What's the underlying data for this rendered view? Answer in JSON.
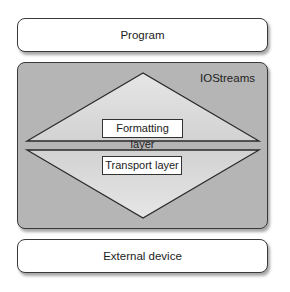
{
  "diagram": {
    "top_box": {
      "label": "Program"
    },
    "middle_box": {
      "label": "IOStreams",
      "layers": [
        {
          "label": "Formatting layer",
          "shape": "upward-triangle"
        },
        {
          "label": "Transport layer",
          "shape": "downward-triangle"
        }
      ]
    },
    "bottom_box": {
      "label": "External device"
    }
  },
  "colors": {
    "container_fill": "#b5b5b5",
    "triangle_fill": "#dcdcdc",
    "outline": "#333333",
    "box_fill": "#ffffff"
  }
}
